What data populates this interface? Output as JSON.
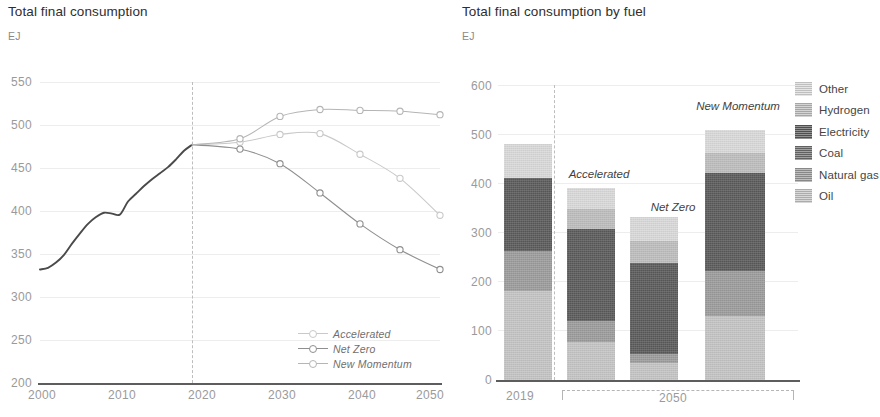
{
  "left": {
    "title": "Total final consumption",
    "unit": "EJ",
    "y_ticks": [
      "200",
      "250",
      "300",
      "350",
      "400",
      "450",
      "500",
      "550"
    ],
    "x_ticks": [
      "2000",
      "2010",
      "2020",
      "2030",
      "2040",
      "2050"
    ],
    "legend": [
      {
        "label": "Accelerated",
        "color": "#c9c9c9"
      },
      {
        "label": "Net Zero",
        "color": "#8f8f8f"
      },
      {
        "label": "New Momentum",
        "color": "#b5b5b5"
      }
    ]
  },
  "right": {
    "title": "Total final consumption by fuel",
    "unit": "EJ",
    "y_ticks": [
      "0",
      "100",
      "200",
      "300",
      "400",
      "500",
      "600"
    ],
    "x_ticks": [
      "2019",
      "2050"
    ],
    "bar_labels": [
      "Accelerated",
      "Net Zero",
      "New Momentum"
    ],
    "legend": [
      {
        "label": "Other",
        "color": "#d9d9d9"
      },
      {
        "label": "Hydrogen",
        "color": "#bdbdbd"
      },
      {
        "label": "Electricity",
        "color": "#5a5a5a"
      },
      {
        "label": "Coal",
        "color": "#6e6e6e"
      },
      {
        "label": "Natural gas",
        "color": "#9b9b9b"
      },
      {
        "label": "Oil",
        "color": "#c4c4c4"
      }
    ]
  },
  "chart_data": [
    {
      "type": "line",
      "title": "Total final consumption",
      "xlabel": "",
      "ylabel": "EJ",
      "ylim": [
        200,
        550
      ],
      "xlim": [
        2000,
        2050
      ],
      "grid": true,
      "legend_position": "inside-bottom-right",
      "annotations": [
        {
          "type": "vline",
          "x": 2019,
          "style": "dashed",
          "label": ""
        }
      ],
      "series": [
        {
          "name": "History",
          "color": "#4a4a4a",
          "marker": false,
          "x": [
            2000,
            2001,
            2002,
            2003,
            2004,
            2005,
            2006,
            2007,
            2008,
            2009,
            2010,
            2011,
            2012,
            2013,
            2014,
            2015,
            2016,
            2017,
            2018,
            2019
          ],
          "values": [
            332,
            334,
            340,
            349,
            362,
            374,
            385,
            393,
            398,
            397,
            396,
            411,
            420,
            429,
            437,
            444,
            451,
            460,
            470,
            477
          ]
        },
        {
          "name": "Accelerated",
          "color": "#c9c9c9",
          "marker": true,
          "x": [
            2019,
            2025,
            2030,
            2035,
            2040,
            2045,
            2050
          ],
          "values": [
            477,
            480,
            489,
            490,
            466,
            438,
            395
          ]
        },
        {
          "name": "Net Zero",
          "color": "#8f8f8f",
          "marker": true,
          "x": [
            2019,
            2025,
            2030,
            2035,
            2040,
            2045,
            2050
          ],
          "values": [
            477,
            472,
            455,
            421,
            385,
            355,
            332
          ]
        },
        {
          "name": "New Momentum",
          "color": "#b5b5b5",
          "marker": true,
          "x": [
            2019,
            2025,
            2030,
            2035,
            2040,
            2045,
            2050
          ],
          "values": [
            477,
            484,
            510,
            518,
            517,
            516,
            512
          ]
        }
      ]
    },
    {
      "type": "bar",
      "subtype": "stacked",
      "title": "Total final consumption by fuel",
      "xlabel": "",
      "ylabel": "EJ",
      "ylim": [
        0,
        600
      ],
      "grid": true,
      "legend_position": "right",
      "categories": [
        "2019",
        "Accelerated",
        "Net Zero",
        "New Momentum"
      ],
      "category_groups": [
        {
          "label": "2019",
          "members": [
            "2019"
          ]
        },
        {
          "label": "2050",
          "members": [
            "Accelerated",
            "Net Zero",
            "New Momentum"
          ]
        }
      ],
      "series": [
        {
          "name": "Oil",
          "color": "#c4c4c4",
          "values": [
            182,
            78,
            35,
            130
          ]
        },
        {
          "name": "Natural gas",
          "color": "#9b9b9b",
          "values": [
            80,
            42,
            17,
            92
          ]
        },
        {
          "name": "Coal",
          "color": "#6e6e6e",
          "values": [
            0,
            0,
            0,
            0
          ]
        },
        {
          "name": "Electricity",
          "color": "#5a5a5a",
          "values": [
            148,
            187,
            185,
            200
          ]
        },
        {
          "name": "Hydrogen",
          "color": "#bdbdbd",
          "values": [
            0,
            40,
            46,
            40
          ]
        },
        {
          "name": "Other",
          "color": "#d9d9d9",
          "values": [
            70,
            43,
            49,
            46
          ]
        }
      ],
      "totals": [
        480,
        390,
        332,
        508
      ]
    }
  ]
}
